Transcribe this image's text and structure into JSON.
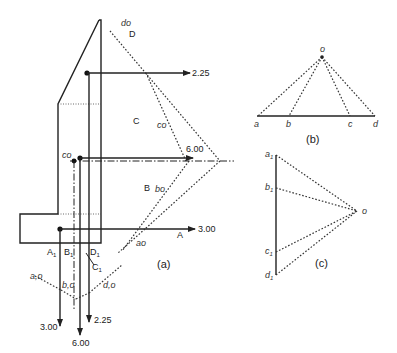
{
  "figure_a": {
    "caption": "(a)",
    "loads": {
      "horizontal": [
        {
          "id": "D",
          "value": "2.25",
          "name": "D"
        },
        {
          "id": "C",
          "value": "6.00",
          "name": "C"
        },
        {
          "id": "A",
          "value": "3.00",
          "name": "A"
        }
      ],
      "vertical": [
        {
          "id": "A1",
          "value": "3.00"
        },
        {
          "id": "C1",
          "value": "6.00"
        },
        {
          "id": "D1",
          "value": "2.25"
        }
      ]
    },
    "region_labels": {
      "C": "C",
      "B": "B",
      "A": "A",
      "D": "D"
    },
    "ray_labels": {
      "do": "do",
      "co": "co",
      "bo": "bo",
      "ao": "ao",
      "co_top": "co"
    },
    "line_labels": {
      "A1": "A",
      "B1": "B",
      "C1": "C",
      "D1": "D",
      "sub": "1"
    },
    "funicular_labels": {
      "ao": "a,o",
      "bo": "b,o",
      "do": "d,o"
    }
  },
  "figure_b": {
    "caption": "(b)",
    "pole": "o",
    "points": [
      "a",
      "b",
      "c",
      "d"
    ]
  },
  "figure_c": {
    "caption": "(c)",
    "pole": "o",
    "points": [
      {
        "base": "a",
        "sub": "1"
      },
      {
        "base": "b",
        "sub": "1"
      },
      {
        "base": "c",
        "sub": "1"
      },
      {
        "base": "d",
        "sub": "1"
      }
    ]
  }
}
